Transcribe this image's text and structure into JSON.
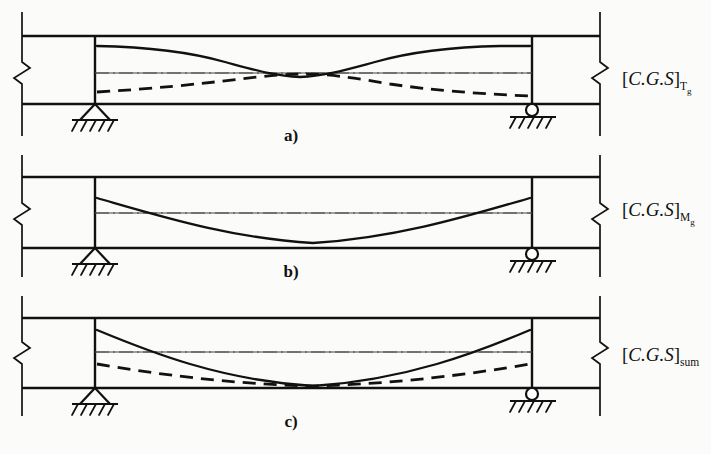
{
  "figure": {
    "background_color": "#fbfbf9",
    "line_color": "#111111",
    "thin_line_color": "#555555"
  },
  "panels": [
    {
      "id": "a",
      "caption": "a)",
      "cgs_label": {
        "bracket_open": "[",
        "body": "C.G.S",
        "bracket_close": "]",
        "subscript_main": "T",
        "subscript_secondary": "g",
        "full_text": "[C.G.S]Tg"
      },
      "curves": [
        {
          "name": "solid-cgs-curve",
          "style": "solid",
          "shape": "double-curvature-s-profile"
        },
        {
          "name": "dashed-cgs-curve",
          "style": "dashed",
          "shape": "descending-crossing-profile"
        }
      ],
      "centerline_style": "dash-dot",
      "left_support": "pinned",
      "right_support": "roller"
    },
    {
      "id": "b",
      "caption": "b)",
      "cgs_label": {
        "bracket_open": "[",
        "body": "C.G.S",
        "bracket_close": "]",
        "subscript_main": "M",
        "subscript_secondary": "g",
        "full_text": "[C.G.S]Mg"
      },
      "curves": [
        {
          "name": "solid-cgs-curve",
          "style": "solid",
          "shape": "parabolic-sag-profile"
        }
      ],
      "centerline_style": "dash-dot",
      "left_support": "pinned",
      "right_support": "roller"
    },
    {
      "id": "c",
      "caption": "c)",
      "cgs_label": {
        "bracket_open": "[",
        "body": "C.G.S",
        "bracket_close": "]",
        "subscript_main": "sum",
        "subscript_secondary": "",
        "full_text": "[C.G.S]sum"
      },
      "curves": [
        {
          "name": "solid-cgs-curve",
          "style": "solid",
          "shape": "deep-parabolic-sag-profile"
        },
        {
          "name": "dashed-cgs-curve",
          "style": "dashed",
          "shape": "shallow-parabolic-sag-profile"
        }
      ],
      "centerline_style": "dash-dot",
      "left_support": "pinned",
      "right_support": "roller"
    }
  ],
  "chart_data": {
    "type": "line",
    "xlabel": "",
    "ylabel": "",
    "x": [
      0,
      0.1,
      0.2,
      0.3,
      0.4,
      0.5,
      0.6,
      0.7,
      0.8,
      0.9,
      1.0
    ],
    "panels": [
      {
        "id": "a",
        "label": "[C.G.S]Tg",
        "series": [
          {
            "name": "solid-cgs-curve",
            "style": "solid",
            "values": [
              -0.78,
              -0.74,
              -0.6,
              -0.32,
              -0.02,
              0.06,
              -0.02,
              -0.32,
              -0.6,
              -0.74,
              -0.78
            ]
          },
          {
            "name": "dashed-cgs-curve",
            "style": "dashed",
            "values": [
              0.62,
              0.52,
              0.38,
              0.2,
              0.04,
              -0.04,
              0.04,
              0.2,
              0.38,
              0.52,
              0.62
            ]
          }
        ]
      },
      {
        "id": "b",
        "label": "[C.G.S]Mg",
        "series": [
          {
            "name": "solid-cgs-curve",
            "style": "solid",
            "values": [
              -0.6,
              -0.24,
              0.08,
              0.36,
              0.54,
              0.62,
              0.54,
              0.36,
              0.08,
              -0.24,
              -0.6
            ]
          }
        ]
      },
      {
        "id": "c",
        "label": "[C.G.S]sum",
        "series": [
          {
            "name": "solid-cgs-curve",
            "style": "solid",
            "values": [
              -0.82,
              -0.36,
              0.06,
              0.42,
              0.66,
              0.76,
              0.66,
              0.42,
              0.06,
              -0.36,
              -0.82
            ]
          },
          {
            "name": "dashed-cgs-curve",
            "style": "dashed",
            "values": [
              0.3,
              0.44,
              0.56,
              0.66,
              0.73,
              0.76,
              0.73,
              0.66,
              0.56,
              0.44,
              0.3
            ]
          }
        ]
      }
    ],
    "ylim": [
      -1,
      1
    ],
    "grid": false,
    "legend": "none",
    "annotations": [
      "a)",
      "b)",
      "c)",
      "[C.G.S]Tg",
      "[C.G.S]Mg",
      "[C.G.S]sum"
    ]
  }
}
